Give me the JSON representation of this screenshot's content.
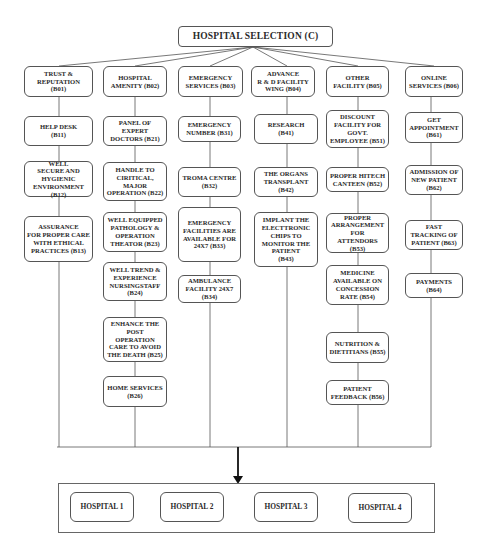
{
  "title": "HOSPITAL SELECTION  (C)",
  "criteria": [
    {
      "id": "B01",
      "label": "TRUST &\nREPUTATION\n(B01)",
      "sub": [
        {
          "id": "B11",
          "label": "HELP DESK\n(B11)"
        },
        {
          "id": "B12",
          "label": "WELL\nSECURE AND\nHYGIENIC\nENVIRONMENT (B12)"
        },
        {
          "id": "B13",
          "label": "ASSURANCE\nFOR PROPER CARE\nWITH ETHICAL\nPRACTICES (B13)"
        }
      ]
    },
    {
      "id": "B02",
      "label": "HOSPITAL\nAMENITY  (B02)",
      "sub": [
        {
          "id": "B21",
          "label": "PANEL OF\nEXPERT\nDOCTORS (B21)"
        },
        {
          "id": "B22",
          "label": "HANDLE TO\nCIRITICAL,\nMAJOR\nOPERATION (B22)"
        },
        {
          "id": "B23",
          "label": "WELL EQUIPPED\nPATHOLOGY &\nOPERATION\nTHEATOR (B23)"
        },
        {
          "id": "B24",
          "label": "WELL TREND &\nEXPERIENCE\nNURSINGSTAFF\n(B24)"
        },
        {
          "id": "B25",
          "label": "ENHANCE THE\nPOST\nOPERATION\nCARE TO AVOID\nTHE DEATH (B25)"
        },
        {
          "id": "B26",
          "label": "HOME SERVICES\n(B26)"
        }
      ]
    },
    {
      "id": "B03",
      "label": "EMERGENCY\nSERVICES (B03)",
      "sub": [
        {
          "id": "B31",
          "label": "EMERGENCY\nNUMBER (B31)"
        },
        {
          "id": "B32",
          "label": "TROMA CENTRE\n(B32)"
        },
        {
          "id": "B33",
          "label": "EMERGENCY\nFACILITIES ARE\nAVAILABLE FOR\n24X7 (B33)"
        },
        {
          "id": "B34",
          "label": "AMBULANCE\nFACILITY 24X7\n(B34)"
        }
      ]
    },
    {
      "id": "B04",
      "label": "ADVANCE\nR & D FACILITY\nWING (B04)",
      "sub": [
        {
          "id": "B41",
          "label": "RESEARCH\n(B41)"
        },
        {
          "id": "B42",
          "label": "THE ORGANS\nTRANSPLANT\n(B42)"
        },
        {
          "id": "B43",
          "label": "IMPLANT THE\nELECTTRONIC\nCHIPS TO\nMONITOR THE\nPATIENT\n(B43)"
        }
      ]
    },
    {
      "id": "B05",
      "label": "OTHER\nFACILITY (B05)",
      "sub": [
        {
          "id": "B51",
          "label": "DISCOUNT\nFACILITY FOR\nGOVT.\nEMPLOYEE (B51)"
        },
        {
          "id": "B52",
          "label": "PROPER HITECH\nCANTEEN (B52)"
        },
        {
          "id": "B53",
          "label": "PROPER\nARRANGEMENT\nFOR\nATTENDORS (B53)"
        },
        {
          "id": "B54",
          "label": "MEDICINE\nAVAILABLE ON\nCONCESSION\nRATE (B54)"
        },
        {
          "id": "B55",
          "label": "NUTRITION &\nDIETITIANS (B55)"
        },
        {
          "id": "B56",
          "label": "PATIENT\nFEEDBACK (B56)"
        }
      ]
    },
    {
      "id": "B06",
      "label": "ONLINE\nSERVICES (B06)",
      "sub": [
        {
          "id": "B61",
          "label": "GET\nAPPOINTMENT\n(B61)"
        },
        {
          "id": "B62",
          "label": "ADMISSION OF\nNEW PATIENT\n(B62)"
        },
        {
          "id": "B63",
          "label": "FAST\nTRACKING OF\nPATIENT (B63)"
        },
        {
          "id": "B64",
          "label": "PAYMENTS\n(B64)"
        }
      ]
    }
  ],
  "alternatives": [
    "HOSPITAL 1",
    "HOSPITAL 2",
    "HOSPITAL 3",
    "HOSPITAL 4"
  ],
  "colors": {
    "line": "#555555",
    "border": "#555555",
    "text": "#2a2a2a",
    "arrow": "#111111"
  }
}
